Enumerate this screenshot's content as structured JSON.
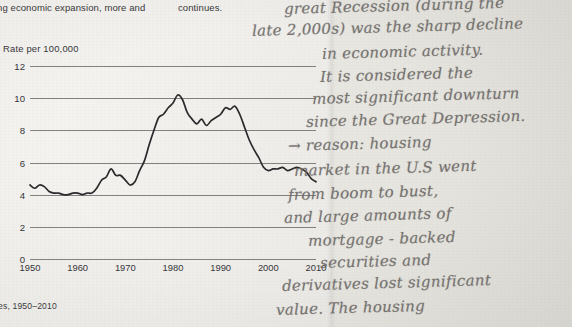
{
  "page": {
    "body_text_left": "ng economic expansion, more and",
    "body_text_right": "continues.",
    "figure_caption": "ies, 1950–2010"
  },
  "chart_data": {
    "type": "line",
    "title": "",
    "ylabel": "Rate per 100,000",
    "xlabel": "",
    "ylim": [
      0,
      12
    ],
    "xlim": [
      1950,
      2010
    ],
    "ytick_labels": [
      "0",
      "2",
      "4",
      "6",
      "8",
      "10",
      "12"
    ],
    "ytick_values": [
      0,
      2,
      4,
      6,
      8,
      10,
      12
    ],
    "xtick_labels": [
      "1950",
      "1960",
      "1970",
      "1980",
      "1990",
      "2000",
      "2010"
    ],
    "xtick_values": [
      1950,
      1960,
      1970,
      1980,
      1990,
      2000,
      2010
    ],
    "grid": true,
    "legend": "none",
    "series": [
      {
        "name": "Rate per 100,000",
        "x": [
          1950,
          1951,
          1952,
          1953,
          1954,
          1955,
          1956,
          1957,
          1958,
          1959,
          1960,
          1961,
          1962,
          1963,
          1964,
          1965,
          1966,
          1967,
          1968,
          1969,
          1970,
          1971,
          1972,
          1973,
          1974,
          1975,
          1976,
          1977,
          1978,
          1979,
          1980,
          1981,
          1982,
          1983,
          1984,
          1985,
          1986,
          1987,
          1988,
          1989,
          1990,
          1991,
          1992,
          1993,
          1994,
          1995,
          1996,
          1997,
          1998,
          1999,
          2000,
          2001,
          2002,
          2003,
          2004,
          2005,
          2006,
          2007,
          2008,
          2009,
          2010
        ],
        "values": [
          4.6,
          4.4,
          4.6,
          4.5,
          4.2,
          4.1,
          4.1,
          4.0,
          4.0,
          4.1,
          4.1,
          4.0,
          4.1,
          4.1,
          4.4,
          4.9,
          5.1,
          5.6,
          5.2,
          5.2,
          4.9,
          4.6,
          4.8,
          5.5,
          6.1,
          7.1,
          8.0,
          8.8,
          9.0,
          9.4,
          9.7,
          10.2,
          9.9,
          9.1,
          8.7,
          8.4,
          8.7,
          8.3,
          8.6,
          8.8,
          9.0,
          9.4,
          9.3,
          9.5,
          9.0,
          8.2,
          7.4,
          6.8,
          6.3,
          5.7,
          5.5,
          5.6,
          5.6,
          5.7,
          5.5,
          5.6,
          5.7,
          5.6,
          5.4,
          5.0,
          4.8
        ]
      }
    ]
  },
  "annotation": {
    "lines": [
      "great Recession (during the",
      "late 2,000s) was the sharp decline",
      "in economic activity.",
      "It is considered the",
      "most significant downturn",
      "since the Great Depression.",
      "→ reason: housing",
      "market in the U.S went",
      "from boom to bust,",
      "and large amounts of",
      "mortgage - backed",
      "securities and",
      "derivatives lost significant",
      "value. The housing"
    ]
  },
  "colors": {
    "paper_left": "#f3f2ef",
    "paper_right": "#e6e4de",
    "ink_print": "#39373a",
    "ink_handwriting": "#6d6a68",
    "gridline": "#6f6d6c",
    "series_line": "#2b2a2c"
  }
}
